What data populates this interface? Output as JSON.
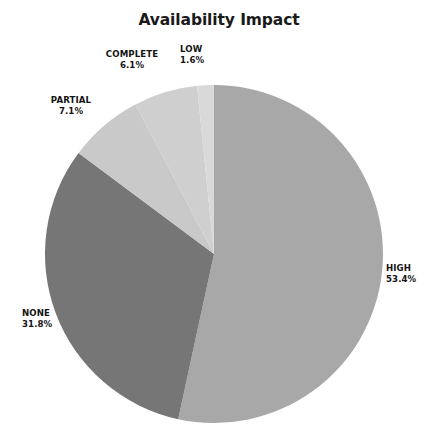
{
  "chart_data": {
    "type": "pie",
    "title": "Availability Impact",
    "xlabel": "",
    "ylabel": "",
    "legend": "none",
    "grid": false,
    "start_angle_deg": 90,
    "direction": "clockwise",
    "categories": [
      "HIGH",
      "NONE",
      "PARTIAL",
      "COMPLETE",
      "LOW"
    ],
    "values": [
      53.4,
      31.8,
      7.1,
      6.1,
      1.6
    ],
    "value_unit": "percent",
    "labels": [
      {
        "name": "HIGH",
        "pct": "53.4%",
        "value": 53.4,
        "color": "#a8a8a8"
      },
      {
        "name": "NONE",
        "pct": "31.8%",
        "value": 31.8,
        "color": "#767676"
      },
      {
        "name": "PARTIAL",
        "pct": "7.1%",
        "value": 7.1,
        "color": "#c9c9c9"
      },
      {
        "name": "COMPLETE",
        "pct": "6.1%",
        "value": 6.1,
        "color": "#cfcfcf"
      },
      {
        "name": "LOW",
        "pct": "1.6%",
        "value": 1.6,
        "color": "#d9d9d9"
      }
    ],
    "colors": [
      "#a8a8a8",
      "#767676",
      "#c9c9c9",
      "#cfcfcf",
      "#d9d9d9"
    ],
    "background": "#ffffff",
    "title_color": "#1a1a1a",
    "label_color": "#141414",
    "geometry": {
      "cx": 214,
      "cy": 254,
      "r": 169
    }
  }
}
